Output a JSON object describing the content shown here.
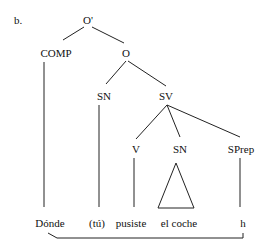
{
  "example_label": "b.",
  "nodes": {
    "root": "O'",
    "comp": "COMP",
    "o": "O",
    "sn_subject": "SN",
    "sv": "SV",
    "v": "V",
    "sn_object": "SN",
    "sprep": "SPrep"
  },
  "leaves": {
    "donde": "Dónde",
    "tu": "(tú)",
    "pusiste": "pusiste",
    "el_coche": "el coche",
    "h": "h"
  },
  "tree_structure": {
    "O'": [
      "COMP",
      "O"
    ],
    "COMP": [
      "Dónde"
    ],
    "O": [
      "SN",
      "SV"
    ],
    "SN": [
      "(tú)"
    ],
    "SV": [
      "V",
      "SN",
      "SPrep"
    ],
    "V": [
      "pusiste"
    ],
    "SN (object)": [
      "el coche (triangle)"
    ],
    "SPrep": [
      "h"
    ]
  },
  "movement_link": {
    "from": "h",
    "to": "Dónde"
  }
}
